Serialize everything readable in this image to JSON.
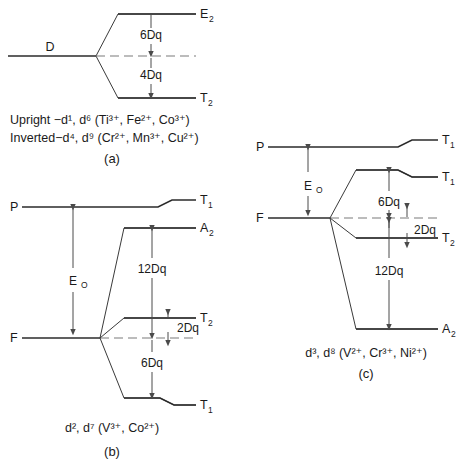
{
  "figure": {
    "type": "energy-level-diagram",
    "title": "",
    "panels": [
      {
        "id": "a",
        "caption_label": "(a)",
        "ground_term": "D",
        "levels": [
          {
            "label": "E",
            "sub": "2",
            "position": "upper",
            "split": "6Dq"
          },
          {
            "label": "T",
            "sub": "2",
            "position": "lower",
            "split": "4Dq"
          }
        ],
        "gaps": [
          "6Dq",
          "4Dq"
        ],
        "notes": [
          {
            "prefix": "Upright ",
            "dash": "−",
            "config": "d",
            "sup1": "1",
            "config2": "d",
            "sup2": "6",
            "ions": "(Ti³⁺, Fe²⁺, Co³⁺)"
          },
          {
            "prefix": "Inverted",
            "dash": "−",
            "config": "d",
            "sup1": "4",
            "config2": "d",
            "sup2": "9",
            "ions": "(Cr²⁺, Mn³⁺, Cu²⁺)"
          }
        ],
        "note_lines": [
          "Upright −d¹, d⁶ (Ti³⁺, Fe²⁺, Co³⁺)",
          "Inverted−d⁴, d⁹ (Cr²⁺, Mn³⁺, Cu²⁺)"
        ]
      },
      {
        "id": "b",
        "caption_label": "(b)",
        "free_ion_terms": [
          "P",
          "F"
        ],
        "levels": [
          {
            "label": "T",
            "sub": "1",
            "from": "P"
          },
          {
            "label": "A",
            "sub": "2",
            "from": "F"
          },
          {
            "label": "T",
            "sub": "2",
            "from": "F"
          },
          {
            "label": "T",
            "sub": "1",
            "from": "F"
          }
        ],
        "gaps": [
          "E₀",
          "12Dq",
          "2Dq",
          "6Dq"
        ],
        "gap_eo": "E",
        "gap_eo_sub": "O",
        "gap_12dq": "12Dq",
        "gap_2dq": "2Dq",
        "gap_6dq": "6Dq",
        "configuration": "d², d⁷ (V³⁺, Co²⁺)"
      },
      {
        "id": "c",
        "caption_label": "(c)",
        "free_ion_terms": [
          "P",
          "F"
        ],
        "levels": [
          {
            "label": "T",
            "sub": "1",
            "from": "P"
          },
          {
            "label": "T",
            "sub": "1",
            "from": "F"
          },
          {
            "label": "T",
            "sub": "2",
            "from": "F"
          },
          {
            "label": "A",
            "sub": "2",
            "from": "F"
          }
        ],
        "gaps": [
          "E₀",
          "6Dq",
          "2Dq",
          "12Dq"
        ],
        "gap_eo": "E",
        "gap_eo_sub": "O",
        "gap_6dq": "6Dq",
        "gap_2dq": "2Dq",
        "gap_12dq": "12Dq",
        "configuration": "d³, d⁸ (V²⁺, Cr³⁺, Ni²⁺)"
      }
    ],
    "colors": {
      "line": "#2b2b2b",
      "dashed": "#7b7b7b",
      "arrow": "#4a4a4a",
      "text": "#1a1a1a",
      "background": "#ffffff"
    }
  }
}
